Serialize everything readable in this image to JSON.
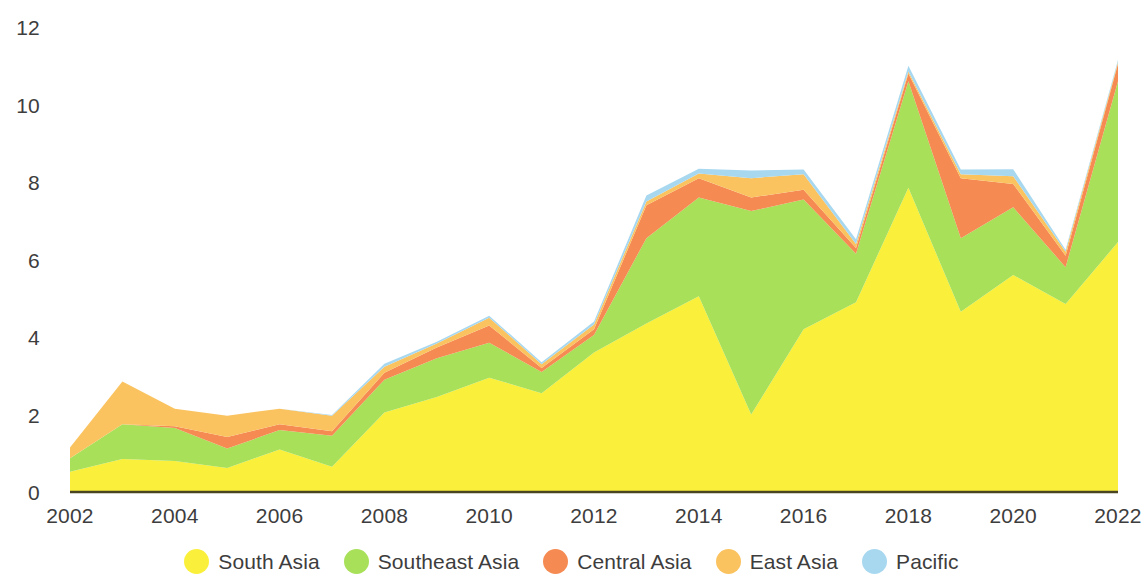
{
  "chart_data": {
    "type": "area",
    "stacked": true,
    "title": "",
    "subtitle": "",
    "xlabel": "",
    "ylabel": "",
    "grid": false,
    "legend_position": "bottom",
    "xlim": [
      2002,
      2022
    ],
    "ylim": [
      0,
      12
    ],
    "yticks": [
      0,
      2,
      4,
      6,
      8,
      10,
      12
    ],
    "ytick_labels": [
      "0",
      "2",
      "4",
      "6",
      "8",
      "10",
      "12"
    ],
    "xticks": [
      2002,
      2004,
      2006,
      2008,
      2010,
      2012,
      2014,
      2016,
      2018,
      2020,
      2022
    ],
    "xtick_labels": [
      "2002",
      "2004",
      "2006",
      "2008",
      "2010",
      "2012",
      "2014",
      "2016",
      "2018",
      "2020",
      "2022"
    ],
    "x": [
      2002,
      2003,
      2004,
      2005,
      2006,
      2007,
      2008,
      2009,
      2010,
      2011,
      2012,
      2013,
      2014,
      2015,
      2016,
      2017,
      2018,
      2019,
      2020,
      2021,
      2022
    ],
    "series": [
      {
        "name": "South Asia",
        "color": "#faf03c",
        "values": [
          0.52,
          0.85,
          0.8,
          0.62,
          1.1,
          0.65,
          2.05,
          2.45,
          2.95,
          2.55,
          3.6,
          4.35,
          5.05,
          2.0,
          4.2,
          4.9,
          7.85,
          4.65,
          5.6,
          4.85,
          6.45
        ]
      },
      {
        "name": "Southeast Asia",
        "color": "#a8e05a",
        "values": [
          0.35,
          0.9,
          0.85,
          0.5,
          0.5,
          0.8,
          0.85,
          1.0,
          0.9,
          0.55,
          0.45,
          2.2,
          2.55,
          5.25,
          3.35,
          1.25,
          2.75,
          1.9,
          1.75,
          0.95,
          4.15
        ]
      },
      {
        "name": "Central Asia",
        "color": "#f58b52",
        "values": [
          0.0,
          0.0,
          0.05,
          0.3,
          0.15,
          0.12,
          0.18,
          0.28,
          0.45,
          0.1,
          0.15,
          0.85,
          0.5,
          0.35,
          0.25,
          0.15,
          0.2,
          1.55,
          0.6,
          0.3,
          0.45
        ]
      },
      {
        "name": "East Asia",
        "color": "#fac360",
        "values": [
          0.28,
          1.1,
          0.45,
          0.55,
          0.4,
          0.4,
          0.15,
          0.1,
          0.2,
          0.1,
          0.12,
          0.1,
          0.12,
          0.5,
          0.4,
          0.1,
          0.05,
          0.1,
          0.2,
          0.1,
          0.05
        ]
      },
      {
        "name": "Pacific",
        "color": "#a8d8f0",
        "values": [
          0.0,
          0.0,
          0.0,
          0.0,
          0.0,
          0.02,
          0.08,
          0.05,
          0.05,
          0.05,
          0.08,
          0.15,
          0.12,
          0.2,
          0.12,
          0.12,
          0.15,
          0.12,
          0.18,
          0.05,
          0.05
        ]
      }
    ]
  },
  "legend": {
    "items": [
      {
        "label": "South Asia",
        "color": "#faf03c"
      },
      {
        "label": "Southeast Asia",
        "color": "#a8e05a"
      },
      {
        "label": "Central Asia",
        "color": "#f58b52"
      },
      {
        "label": "East Asia",
        "color": "#fac360"
      },
      {
        "label": "Pacific",
        "color": "#a8d8f0"
      }
    ]
  },
  "axis_text_color": "#3d3d3d",
  "baseline_color": "#4a4520"
}
